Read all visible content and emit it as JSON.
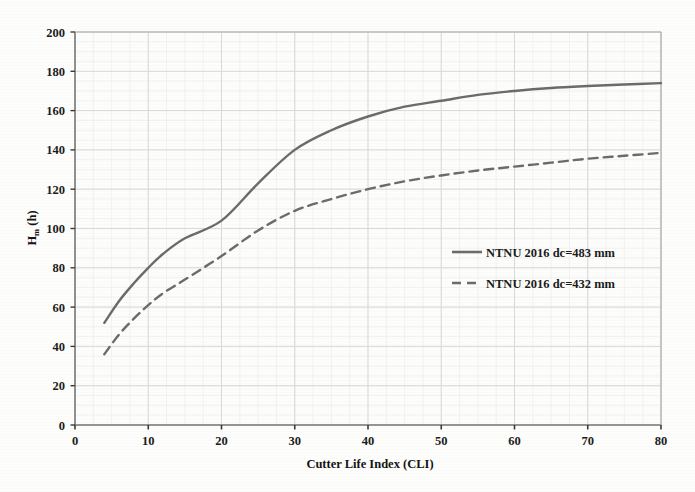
{
  "figure": {
    "background_color": "#fdfdfc",
    "plot_border_color": "#8d8d8d",
    "grid_color_major": "#d9d9d9",
    "grid_color_minor": "#ececec",
    "curve_color": "#6b6b6b",
    "text_color": "#1b1b1b"
  },
  "axis": {
    "y_title_main": "H",
    "y_title_sub": "m",
    "y_title_unit": " (h)",
    "y_title_full": "Hm (h)",
    "x_title": "Cutter Life Index (CLI)"
  },
  "legend": {
    "position": "center-right inside plot",
    "items": [
      {
        "label": "NTNU 2016 dc=483 mm",
        "style": "solid",
        "color": "#6b6b6b"
      },
      {
        "label": "NTNU 2016 dc=432 mm",
        "style": "dashed",
        "color": "#6b6b6b"
      }
    ]
  },
  "chart_data": {
    "type": "line",
    "title": "",
    "subtitle": "",
    "xlabel": "Cutter Life Index (CLI)",
    "ylabel": "Hm (h)",
    "xlim": [
      0,
      80
    ],
    "ylim": [
      0,
      200
    ],
    "xticks": [
      0,
      10,
      20,
      30,
      40,
      50,
      60,
      70,
      80
    ],
    "yticks": [
      0,
      20,
      40,
      60,
      80,
      100,
      120,
      140,
      160,
      180,
      200
    ],
    "xtick_labels": [
      "0",
      "10",
      "20",
      "30",
      "40",
      "50",
      "60",
      "70",
      "80"
    ],
    "ytick_labels": [
      "0",
      "20",
      "40",
      "60",
      "80",
      "100",
      "120",
      "140",
      "160",
      "180",
      "200"
    ],
    "grid": true,
    "minor_grid": true,
    "legend_position": "center right",
    "x": [
      4,
      6,
      8,
      10,
      12,
      15,
      20,
      25,
      30,
      35,
      40,
      45,
      50,
      55,
      60,
      65,
      70,
      75,
      80
    ],
    "series": [
      {
        "name": "NTNU 2016 dc=483 mm",
        "style": "solid",
        "color": "#6b6b6b",
        "values": [
          52,
          63,
          72,
          80,
          87,
          95,
          104,
          123,
          140,
          150,
          157,
          162,
          165,
          168,
          170,
          171.5,
          172.5,
          173.3,
          174
        ]
      },
      {
        "name": "NTNU 2016 dc=432 mm",
        "style": "dashed",
        "color": "#6b6b6b",
        "values": [
          36,
          46,
          54,
          61,
          67,
          74,
          86,
          99,
          109,
          115,
          120,
          124,
          127,
          129.5,
          131.5,
          133.5,
          135.5,
          137,
          138.5
        ]
      }
    ],
    "annotations": []
  }
}
